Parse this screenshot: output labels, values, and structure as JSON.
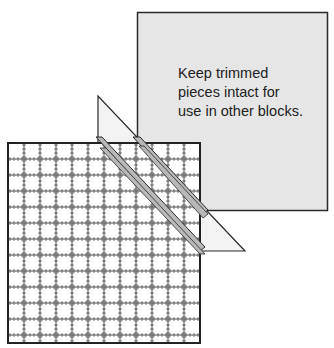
{
  "diagram": {
    "note_lines": [
      "Keep trimmed",
      "pieces intact for",
      "use in other blocks."
    ],
    "colors": {
      "background": "#ffffff",
      "panel_fill": "#e6e6e6",
      "outline": "#2a2a2a",
      "triangle_fill": "#f3f3f3",
      "strip_fill": "#b8b8b8",
      "grid_fill": "#ffffff"
    },
    "elements": [
      {
        "name": "trimmed-pieces-panel",
        "shape": "square",
        "desc": "gray square holding trimmed pieces"
      },
      {
        "name": "ruler-grid-block",
        "shape": "square",
        "desc": "gridded quilt block with ruler marks"
      },
      {
        "name": "trimmed-triangle",
        "shape": "triangle",
        "desc": "triangle trimmed off the block"
      },
      {
        "name": "diagonal-strips",
        "shape": "strips",
        "desc": "two diagonal seam strips"
      }
    ]
  }
}
